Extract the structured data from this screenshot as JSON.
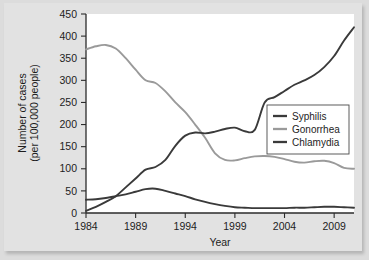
{
  "chart_data": {
    "type": "line",
    "title": "",
    "xlabel": "Year",
    "ylabel": "Number of cases\n(per 100,000 people)",
    "ylabel_line1": "Number of cases",
    "ylabel_line2": "(per 100,000 people)",
    "xlim": [
      1984,
      2011
    ],
    "ylim": [
      0,
      450
    ],
    "yticks": [
      0,
      50,
      100,
      150,
      200,
      250,
      300,
      350,
      400,
      450
    ],
    "xticks": [
      1984,
      1989,
      1994,
      1999,
      2004,
      2009
    ],
    "grid": false,
    "legend_position": "center-right",
    "x": [
      1984,
      1985,
      1986,
      1987,
      1988,
      1989,
      1990,
      1991,
      1992,
      1993,
      1994,
      1995,
      1996,
      1997,
      1998,
      1999,
      2000,
      2001,
      2002,
      2003,
      2004,
      2005,
      2006,
      2007,
      2008,
      2009,
      2010,
      2011
    ],
    "series": [
      {
        "name": "Syphilis",
        "color": "#3a3a3a",
        "values": [
          30,
          31,
          34,
          38,
          42,
          48,
          54,
          55,
          50,
          44,
          38,
          31,
          25,
          20,
          16,
          13,
          12,
          11,
          11,
          11,
          11,
          12,
          12,
          13,
          14,
          14,
          13,
          12
        ]
      },
      {
        "name": "Gonorrhea",
        "color": "#9a9a9a",
        "values": [
          370,
          377,
          380,
          372,
          350,
          324,
          300,
          294,
          275,
          250,
          228,
          200,
          170,
          135,
          120,
          119,
          124,
          128,
          129,
          127,
          122,
          116,
          114,
          117,
          118,
          113,
          102,
          100
        ]
      },
      {
        "name": "Chlamydia",
        "color": "#3a3a3a",
        "values": [
          5,
          14,
          25,
          38,
          58,
          78,
          98,
          104,
          120,
          152,
          175,
          182,
          180,
          184,
          190,
          193,
          185,
          188,
          200,
          210,
          226,
          240,
          248,
          252,
          268,
          290,
          305,
          318
        ]
      }
    ],
    "series_extra": [
      {
        "name": "Chlamydia",
        "values_tail_x": [
          2002,
          2003,
          2004,
          2005,
          2006,
          2007,
          2008,
          2009,
          2010,
          2011
        ],
        "values_tail": [
          250,
          262,
          276,
          290,
          300,
          312,
          330,
          355,
          390,
          420
        ]
      }
    ],
    "annotations": []
  },
  "legend": {
    "entries": [
      {
        "label": "Syphilis",
        "color": "#3a3a3a"
      },
      {
        "label": "Gonorrhea",
        "color": "#9a9a9a"
      },
      {
        "label": "Chlamydia",
        "color": "#3a3a3a"
      }
    ]
  },
  "axis": {
    "x_title": "Year",
    "y_title_line1": "Number of cases",
    "y_title_line2": "(per 100,000 people)",
    "y_tick_labels": [
      "0",
      "50",
      "100",
      "150",
      "200",
      "250",
      "300",
      "350",
      "400",
      "450"
    ],
    "x_tick_labels": [
      "1984",
      "1989",
      "1994",
      "1999",
      "2004",
      "2009"
    ]
  }
}
